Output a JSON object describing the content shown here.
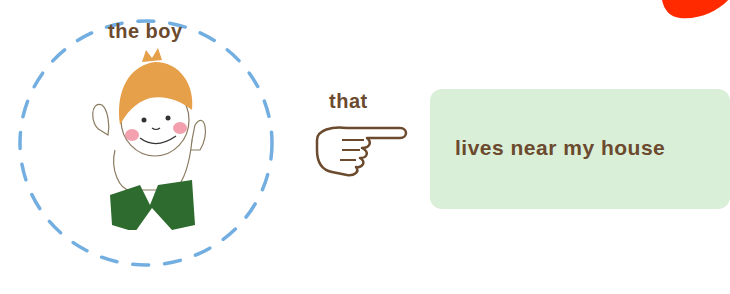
{
  "subject": {
    "label": "the boy"
  },
  "connector": {
    "label": "that"
  },
  "clause": {
    "text": "lives near my house"
  },
  "colors": {
    "text": "#6b4a2e",
    "dashed_circle": "#5aa0dc",
    "clause_box": "#d9efd8",
    "hair": "#e6a04a",
    "collar": "#2e6b2e",
    "cheek": "#f08a9a",
    "corner_blob": "#ff2a00"
  },
  "icons": [
    "dashed-circle-icon",
    "boy-illustration",
    "pointing-hand-icon",
    "red-blob-decoration"
  ]
}
